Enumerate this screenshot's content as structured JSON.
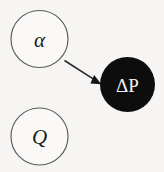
{
  "diagram": {
    "type": "causal-graph",
    "width": 164,
    "height": 172,
    "background_color": "#f6f5f3",
    "nodes": [
      {
        "id": "alpha",
        "label": "α",
        "style": "open",
        "cx": 39.5,
        "cy": 39,
        "r": 28.5,
        "fill_color": "#faf9f7",
        "stroke_color": "#5a5a5a",
        "text_color": "#1b1b1b"
      },
      {
        "id": "delta-p",
        "label": "ΔP",
        "style": "filled",
        "cx": 127.5,
        "cy": 84.5,
        "r": 27.5,
        "fill_color": "#0d0d0d",
        "stroke_color": "#0d0d0d",
        "text_color": "#f2f1ef"
      },
      {
        "id": "q",
        "label": "Q",
        "style": "open",
        "cx": 39.5,
        "cy": 136.5,
        "r": 28.5,
        "fill_color": "#faf9f7",
        "stroke_color": "#5a5a5a",
        "text_color": "#1b1b1b"
      }
    ],
    "edges": [
      {
        "id": "alpha-to-delta-p",
        "from": "alpha",
        "to": "delta-p",
        "x1": 64.5,
        "y1": 60.5,
        "x2": 100.5,
        "y2": 83.5,
        "stroke_color": "#2a2a2a",
        "stroke_width": 1.6,
        "arrowhead": "solid-triangle"
      }
    ]
  }
}
